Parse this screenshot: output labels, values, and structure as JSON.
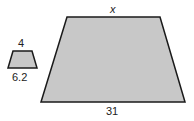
{
  "figure": {
    "small_trapezoid": {
      "top_label": "4",
      "bottom_label": "6.2"
    },
    "large_trapezoid": {
      "top_label": "x",
      "bottom_label": "31"
    },
    "colors": {
      "fill": "#c8c8c8",
      "stroke": "#1a1a1a"
    }
  }
}
